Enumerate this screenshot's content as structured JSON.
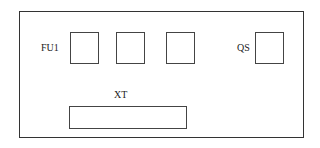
{
  "diagram": {
    "labels": {
      "fuse": "FU1",
      "switch": "QS",
      "terminal": "XT"
    },
    "components": [
      {
        "id": "fu1-1",
        "type": "fuse"
      },
      {
        "id": "fu1-2",
        "type": "fuse"
      },
      {
        "id": "fu1-3",
        "type": "fuse"
      },
      {
        "id": "qs",
        "type": "switch"
      },
      {
        "id": "xt",
        "type": "terminal-block"
      }
    ]
  }
}
